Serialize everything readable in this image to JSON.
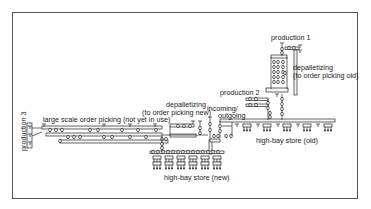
{
  "diagram": {
    "type": "conveyor-layout",
    "labels": {
      "production_1": "production 1",
      "production_2": "production 2",
      "production_3": "production 3",
      "depalletizing_old_line1": "depalletizing",
      "depalletizing_old_line2": "(to order picking old)",
      "depalletizing_new_line1": "depalletizing",
      "depalletizing_new_line2": "(to order picking new)",
      "incoming_line1": "incoming/",
      "incoming_line2": "outgoing",
      "large_scale": "large scale order picking (not yet in use)",
      "high_bay_old": "high-bay store (old)",
      "high_bay_new": "high-bay store (new)"
    },
    "colors": {
      "line": "#2a2a2a",
      "frame": "#555555",
      "background": "#ffffff"
    }
  }
}
